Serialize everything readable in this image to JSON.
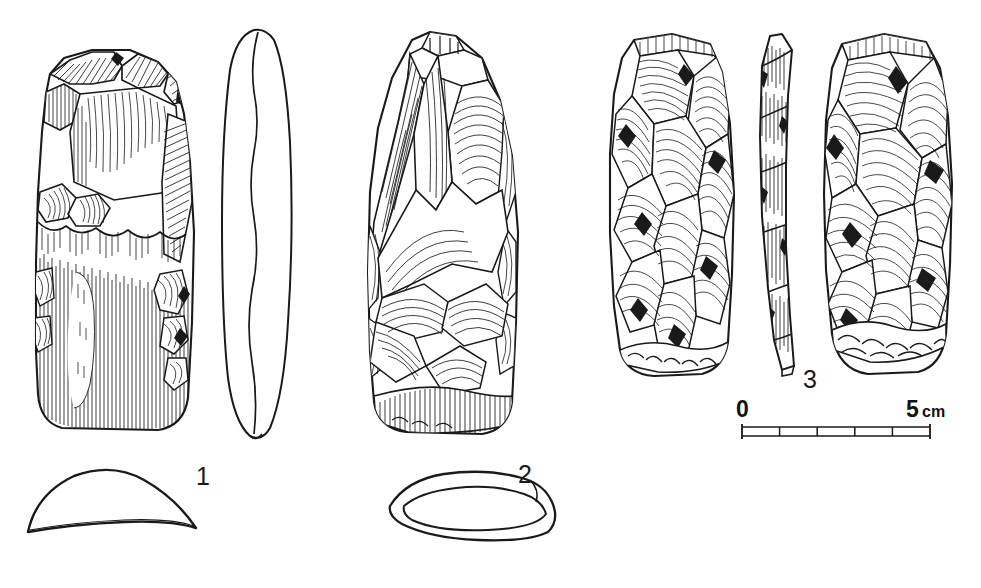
{
  "plate": {
    "kind": "archaeological-lithic-illustration",
    "background_color": "#ffffff",
    "ink_color": "#1a1a1a",
    "width": 981,
    "height": 588
  },
  "figures": [
    {
      "id": "figure-1",
      "label": "1",
      "description": "Polished stone axe, partly flaked butt with ground lower body",
      "views": [
        "face",
        "lateral-profile",
        "cross-section"
      ],
      "shading": "fine-line-hatching"
    },
    {
      "id": "figure-2",
      "label": "2",
      "description": "Flaked stone axe roughout with conchoidal ripple flake scars",
      "views": [
        "face",
        "cross-section"
      ],
      "shading": "ripple-line-flake-scars"
    },
    {
      "id": "figure-3",
      "label": "3",
      "description": "Flaked stone axe, two faces and narrow side profile",
      "views": [
        "face-left",
        "side-profile",
        "face-right"
      ],
      "shading": "dense-stipple-hatching"
    }
  ],
  "scale_bar": {
    "start_label": "0",
    "end_label": "5",
    "unit_label": "cm",
    "divisions": 5,
    "length_px": 188,
    "color": "#1a1a1a"
  }
}
